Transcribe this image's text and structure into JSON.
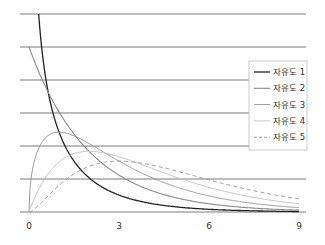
{
  "chart_data": {
    "type": "line",
    "title": "",
    "xlabel": "",
    "ylabel": "",
    "xlim": [
      0,
      9
    ],
    "ylim": [
      0,
      0.6
    ],
    "grid": true,
    "grid_y": [
      0,
      0.1,
      0.2,
      0.3,
      0.4,
      0.5,
      0.6
    ],
    "x_ticks": [
      0,
      3,
      6,
      9
    ],
    "x_tick_labels": [
      "0",
      "3",
      "6",
      "9"
    ],
    "legend_position": "right",
    "series": [
      {
        "name": "자유도 1",
        "df": 1,
        "color": "#222222",
        "dash": "",
        "width": 1.3
      },
      {
        "name": "자유도 2",
        "df": 2,
        "color": "#8a8a8a",
        "dash": "",
        "width": 1.1
      },
      {
        "name": "자유도 3",
        "df": 3,
        "color": "#9a9a9a",
        "dash": "",
        "width": 1
      },
      {
        "name": "자유도 4",
        "df": 4,
        "color": "#c4c4c4",
        "dash": "",
        "width": 1
      },
      {
        "name": "자유도 5",
        "df": 5,
        "color": "#9a9a9a",
        "dash": "4,3",
        "width": 1
      }
    ],
    "x_sample": [
      0,
      0.5,
      1,
      1.5,
      2,
      3,
      4,
      5,
      6,
      7,
      8,
      9
    ],
    "values_approx": {
      "자유도 1": [
        null,
        0.484,
        0.242,
        0.154,
        0.104,
        0.051,
        0.027,
        0.015,
        0.008,
        0.004,
        0.003,
        0.001
      ],
      "자유도 2": [
        0.5,
        0.389,
        0.303,
        0.236,
        0.184,
        0.112,
        0.068,
        0.041,
        0.025,
        0.015,
        0.009,
        0.006
      ],
      "자유도 3": [
        0,
        0.22,
        0.242,
        0.231,
        0.208,
        0.154,
        0.108,
        0.073,
        0.048,
        0.031,
        0.02,
        0.013
      ],
      "자유도 4": [
        0,
        0.097,
        0.152,
        0.177,
        0.184,
        0.167,
        0.135,
        0.103,
        0.075,
        0.053,
        0.037,
        0.025
      ],
      "자유도 5": [
        0,
        0.037,
        0.081,
        0.115,
        0.138,
        0.154,
        0.144,
        0.122,
        0.096,
        0.072,
        0.052,
        0.038
      ]
    }
  },
  "legend": {
    "items": [
      "자유도 1",
      "자유도 2",
      "자유도 3",
      "자유도 4",
      "자유도 5"
    ]
  }
}
